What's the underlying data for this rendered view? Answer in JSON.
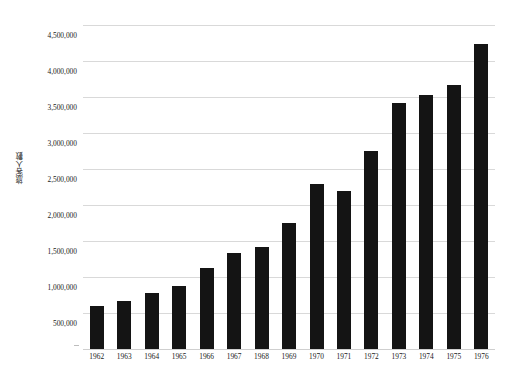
{
  "chart_data": {
    "type": "bar",
    "title": "",
    "subtitle": "",
    "xlabel": "",
    "ylabel": "旅客人數",
    "categories": [
      "1962",
      "1963",
      "1964",
      "1965",
      "1966",
      "1967",
      "1968",
      "1969",
      "1970",
      "1971",
      "1972",
      "1973",
      "1974",
      "1975",
      "1976"
    ],
    "values": [
      600000,
      665000,
      780000,
      875000,
      1125000,
      1330000,
      1420000,
      1750000,
      2290000,
      2195000,
      2750000,
      3415000,
      3525000,
      3665000,
      4235000
    ],
    "ylim": [
      0,
      4500000
    ],
    "ytick_values": [
      500000,
      1000000,
      1500000,
      2000000,
      2500000,
      3000000,
      3500000,
      4000000,
      4500000
    ],
    "ytick_labels": [
      "500,000",
      "1,000,000",
      "1,500,000",
      "2,000,000",
      "2,500,000",
      "3,000,000",
      "3,500,000",
      "4,000,000",
      "4,500,000"
    ],
    "grid": true,
    "legend": false,
    "legend_position": "none",
    "bar_color": "#141414",
    "grid_color": "#d9d9d9",
    "background_color": "#ffffff"
  }
}
